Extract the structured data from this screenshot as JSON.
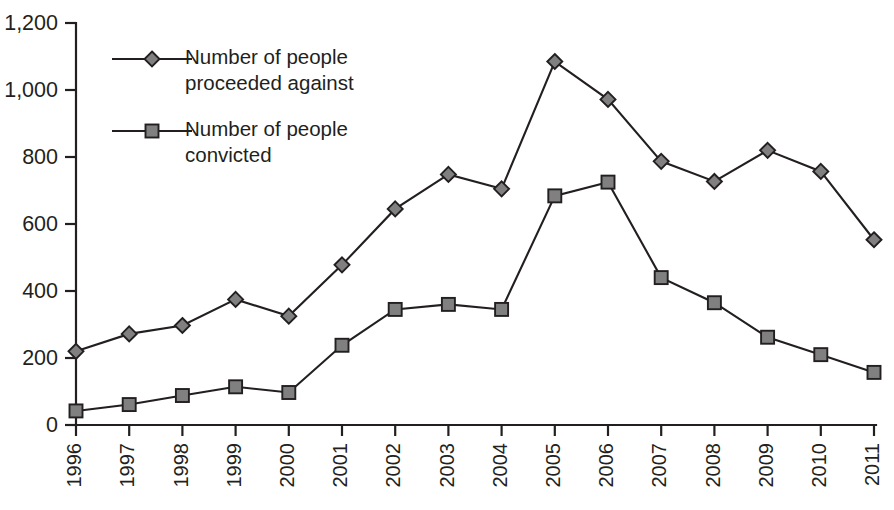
{
  "chart_data": {
    "type": "line",
    "title": "",
    "subtitle": "",
    "xlabel": "",
    "ylabel": "",
    "grid": false,
    "legend_position": "top-left-inside",
    "ylim": [
      0,
      1200
    ],
    "ytick_values": [
      0,
      200,
      400,
      600,
      800,
      1000,
      1200
    ],
    "ytick_labels": [
      "0",
      "200",
      "400",
      "600",
      "800",
      "1,000",
      "1,200"
    ],
    "categories": [
      "1996",
      "1997",
      "1998",
      "1999",
      "2000",
      "2001",
      "2002",
      "2003",
      "2004",
      "2005",
      "2006",
      "2007",
      "2008",
      "2009",
      "2010",
      "2011"
    ],
    "xtick_rotation": -90,
    "series": [
      {
        "name": "Number of people proceeded against",
        "marker": "diamond",
        "marker_fill": "#808080",
        "line_color": "#231f20",
        "values": [
          220,
          272,
          297,
          375,
          325,
          478,
          645,
          748,
          705,
          1085,
          972,
          787,
          727,
          820,
          757,
          553
        ]
      },
      {
        "name": "Number of people convicted",
        "marker": "square",
        "marker_fill": "#808080",
        "line_color": "#231f20",
        "values": [
          42,
          61,
          88,
          114,
          97,
          238,
          345,
          360,
          345,
          684,
          725,
          440,
          365,
          262,
          210,
          157
        ]
      }
    ]
  },
  "legend": {
    "entries": [
      {
        "label_line1": "Number of people",
        "label_line2": "proceeded against",
        "marker": "diamond-icon"
      },
      {
        "label_line1": "Number of people",
        "label_line2": "convicted",
        "marker": "square-icon"
      }
    ]
  },
  "colors": {
    "ink": "#231f20",
    "marker_fill": "#808080",
    "background": "#ffffff"
  }
}
